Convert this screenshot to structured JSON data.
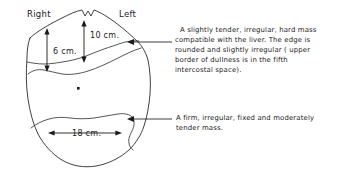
{
  "figure": {
    "background_color": "#ffffff",
    "ink_color": "#1a1a1a"
  },
  "orientation_labels": {
    "right": "Right",
    "left": "Left"
  },
  "measurements": [
    {
      "id": "liver-span-right",
      "label": "6  cm.",
      "value": 6,
      "unit": "cm",
      "axis": "vertical"
    },
    {
      "id": "liver-span-mid",
      "label": "10 cm.",
      "value": 10,
      "unit": "cm",
      "axis": "vertical"
    },
    {
      "id": "lower-mass-width",
      "label": "18 cm.",
      "value": 18,
      "unit": "cm",
      "axis": "horizontal"
    }
  ],
  "annotations": {
    "liver_mass": {
      "id": "upper-annotation",
      "lines": [
        "A slightly tender, irregular, hard mass",
        "compatible with the liver.  The edge is",
        "rounded and slightly irregular ( upper",
        "border of dullness is in the fifth",
        "intercostal space)."
      ]
    },
    "lower_mass": {
      "id": "lower-annotation",
      "lines": [
        "A firm, irregular, fixed and moderately",
        "tender mass."
      ]
    }
  },
  "landmarks": {
    "umbilicus": "umbilicus-dot"
  }
}
